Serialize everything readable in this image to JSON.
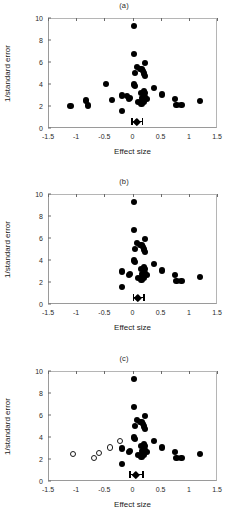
{
  "figure": {
    "background": "#ffffff",
    "marker_filled_color": "#000000",
    "marker_open_color": "#ffffff",
    "axis_color": "#9a9a9a"
  },
  "axes": {
    "xlabel": "Effect size",
    "ylabel": "1/standard error",
    "xticks": [
      "-1.5",
      "-1",
      "-0.5",
      "0",
      "0.5",
      "1",
      "1.5"
    ],
    "xtick_values": [
      -1.5,
      -1,
      -0.5,
      0,
      0.5,
      1,
      1.5
    ],
    "yticks": [
      "0",
      "2",
      "4",
      "6",
      "8",
      "10"
    ],
    "ytick_values": [
      0,
      2,
      4,
      6,
      8,
      10
    ],
    "xlim": [
      -1.5,
      1.5
    ],
    "ylim": [
      0,
      10
    ]
  },
  "panels": [
    {
      "id": "a",
      "title": "(a)"
    },
    {
      "id": "b",
      "title": "(b)"
    },
    {
      "id": "c",
      "title": "(c)"
    }
  ],
  "chart_data": [
    {
      "type": "scatter",
      "title": "(a)",
      "xlabel": "Effect size",
      "ylabel": "1/standard error",
      "xlim": [
        -1.5,
        1.5
      ],
      "ylim": [
        0,
        10
      ],
      "grid": false,
      "legend": "none",
      "series": [
        {
          "name": "observed studies",
          "marker": "filled-circle",
          "points": [
            [
              0.02,
              9.25
            ],
            [
              0.03,
              6.75
            ],
            [
              0.22,
              5.9
            ],
            [
              0.08,
              5.55
            ],
            [
              0.13,
              5.4
            ],
            [
              0.16,
              5.35
            ],
            [
              0.19,
              5.2
            ],
            [
              0.05,
              5.0
            ],
            [
              0.21,
              4.95
            ],
            [
              0.22,
              4.7
            ],
            [
              -0.47,
              4.0
            ],
            [
              0.03,
              3.95
            ],
            [
              0.04,
              3.85
            ],
            [
              0.38,
              3.65
            ],
            [
              0.2,
              3.4
            ],
            [
              0.16,
              3.2
            ],
            [
              0.22,
              3.15
            ],
            [
              0.53,
              3.05
            ],
            [
              -0.19,
              2.95
            ],
            [
              -0.1,
              2.9
            ],
            [
              0.22,
              2.85
            ],
            [
              0.17,
              2.75
            ],
            [
              -0.04,
              2.7
            ],
            [
              -0.06,
              2.65
            ],
            [
              0.26,
              2.65
            ],
            [
              0.75,
              2.6
            ],
            [
              -0.36,
              2.55
            ],
            [
              -0.82,
              2.5
            ],
            [
              1.2,
              2.45
            ],
            [
              0.1,
              2.4
            ],
            [
              0.15,
              2.4
            ],
            [
              0.2,
              2.35
            ],
            [
              0.16,
              2.2
            ],
            [
              0.87,
              2.1
            ],
            [
              0.78,
              2.1
            ],
            [
              -0.79,
              2.05
            ],
            [
              -1.1,
              2.0
            ],
            [
              -0.18,
              1.55
            ]
          ]
        }
      ],
      "summary": {
        "center": 0.08,
        "lower": -0.02,
        "upper": 0.19,
        "y": 0.55
      }
    },
    {
      "type": "scatter",
      "title": "(b)",
      "xlabel": "Effect size",
      "ylabel": "1/standard error",
      "xlim": [
        -1.5,
        1.5
      ],
      "ylim": [
        0,
        10
      ],
      "grid": false,
      "legend": "none",
      "series": [
        {
          "name": "trimmed studies",
          "marker": "filled-circle",
          "points": [
            [
              0.02,
              9.25
            ],
            [
              0.03,
              6.75
            ],
            [
              0.22,
              5.9
            ],
            [
              0.08,
              5.55
            ],
            [
              0.13,
              5.4
            ],
            [
              0.16,
              5.35
            ],
            [
              0.19,
              5.2
            ],
            [
              0.05,
              5.0
            ],
            [
              0.21,
              4.95
            ],
            [
              0.22,
              4.7
            ],
            [
              0.03,
              3.95
            ],
            [
              0.04,
              3.85
            ],
            [
              0.38,
              3.65
            ],
            [
              0.2,
              3.4
            ],
            [
              0.16,
              3.2
            ],
            [
              0.22,
              3.15
            ],
            [
              0.53,
              3.05
            ],
            [
              -0.19,
              2.95
            ],
            [
              0.22,
              2.85
            ],
            [
              0.17,
              2.75
            ],
            [
              -0.04,
              2.7
            ],
            [
              -0.06,
              2.65
            ],
            [
              0.26,
              2.65
            ],
            [
              0.75,
              2.6
            ],
            [
              1.2,
              2.45
            ],
            [
              0.1,
              2.4
            ],
            [
              0.15,
              2.4
            ],
            [
              0.2,
              2.35
            ],
            [
              0.16,
              2.2
            ],
            [
              0.87,
              2.1
            ],
            [
              0.78,
              2.1
            ],
            [
              -0.18,
              1.55
            ]
          ]
        }
      ],
      "summary": {
        "center": 0.1,
        "lower": 0.0,
        "upper": 0.22,
        "y": 0.55
      }
    },
    {
      "type": "scatter",
      "title": "(c)",
      "xlabel": "Effect size",
      "ylabel": "1/standard error",
      "xlim": [
        -1.5,
        1.5
      ],
      "ylim": [
        0,
        10
      ],
      "grid": false,
      "legend": "none",
      "series": [
        {
          "name": "observed studies",
          "marker": "filled-circle",
          "points": [
            [
              0.02,
              9.25
            ],
            [
              0.03,
              6.75
            ],
            [
              0.22,
              5.9
            ],
            [
              0.08,
              5.55
            ],
            [
              0.13,
              5.4
            ],
            [
              0.16,
              5.35
            ],
            [
              0.19,
              5.2
            ],
            [
              0.05,
              5.0
            ],
            [
              0.21,
              4.95
            ],
            [
              0.22,
              4.7
            ],
            [
              0.03,
              3.95
            ],
            [
              0.04,
              3.85
            ],
            [
              0.38,
              3.65
            ],
            [
              0.2,
              3.4
            ],
            [
              0.16,
              3.2
            ],
            [
              0.22,
              3.15
            ],
            [
              0.53,
              3.05
            ],
            [
              -0.19,
              2.95
            ],
            [
              0.22,
              2.85
            ],
            [
              0.17,
              2.75
            ],
            [
              -0.04,
              2.7
            ],
            [
              -0.06,
              2.65
            ],
            [
              0.26,
              2.65
            ],
            [
              0.75,
              2.6
            ],
            [
              1.2,
              2.45
            ],
            [
              0.1,
              2.4
            ],
            [
              0.15,
              2.4
            ],
            [
              0.2,
              2.35
            ],
            [
              0.16,
              2.2
            ],
            [
              0.87,
              2.1
            ],
            [
              0.78,
              2.1
            ],
            [
              -0.18,
              1.55
            ]
          ]
        },
        {
          "name": "imputed studies",
          "marker": "open-circle",
          "points": [
            [
              -0.22,
              3.6
            ],
            [
              -0.4,
              3.05
            ],
            [
              -0.6,
              2.55
            ],
            [
              -1.05,
              2.45
            ],
            [
              -0.68,
              2.1
            ]
          ]
        }
      ],
      "summary": {
        "center": 0.06,
        "lower": -0.06,
        "upper": 0.2,
        "y": 0.55
      }
    }
  ]
}
